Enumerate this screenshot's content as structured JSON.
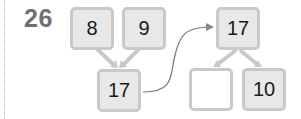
{
  "problem": {
    "number": "26"
  },
  "left_tree": {
    "top_left": "8",
    "top_right": "9",
    "bottom": "17"
  },
  "right_tree": {
    "top": "17",
    "bottom_left": "",
    "bottom_right": "10"
  },
  "colors": {
    "box_fill": "#e8e8e8",
    "box_border": "#c9c9c9",
    "empty_fill": "#ffffff",
    "arrow": "#c9c9c9",
    "connector": "#777777",
    "number": "#707070"
  }
}
